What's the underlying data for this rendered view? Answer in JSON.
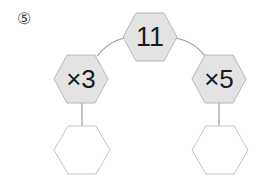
{
  "problem": {
    "number_label": "⑤"
  },
  "nodes": {
    "root": {
      "value": "11"
    },
    "left_op": {
      "value": "×3"
    },
    "right_op": {
      "value": "×5"
    },
    "left_result": {
      "value": ""
    },
    "right_result": {
      "value": ""
    }
  },
  "colors": {
    "filled_hex": "#e3e3e3",
    "empty_hex": "#ffffff",
    "hex_stroke": "#b8b8b8",
    "connector": "#9a9a9a",
    "text": "#1a1a1a"
  }
}
